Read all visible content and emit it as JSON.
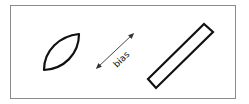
{
  "diagram": {
    "frame_color": "#8a8a8a",
    "shapes": [
      {
        "name": "lens",
        "type": "leaf-shape"
      },
      {
        "name": "bias-arrow",
        "type": "double-headed-arrow",
        "label": "bias"
      },
      {
        "name": "strip",
        "type": "rotated-rectangle"
      }
    ],
    "arrow_label": "bias"
  }
}
